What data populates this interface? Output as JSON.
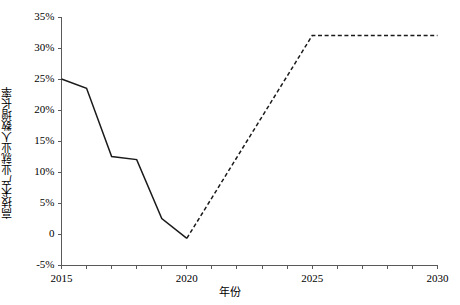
{
  "chart_data": {
    "type": "line",
    "title": "",
    "subtitle": "",
    "xlabel": "年份",
    "ylabel": "高技术产业就业人数增长率",
    "xlim": [
      2015,
      2030
    ],
    "ylim": [
      -5,
      35
    ],
    "grid": false,
    "legend": "none",
    "x_tick_labels": [
      "2015",
      "2020",
      "2025",
      "2030"
    ],
    "x_tick_values": [
      2015,
      2020,
      2025,
      2030
    ],
    "x_minor_ticks": [
      2015,
      2016,
      2017,
      2018,
      2019,
      2020,
      2021,
      2022,
      2023,
      2024,
      2025,
      2026,
      2027,
      2028,
      2029,
      2030
    ],
    "y_tick_labels": [
      "35%",
      "30%",
      "25%",
      "20%",
      "15%",
      "10%",
      "5%",
      "0",
      "-5%"
    ],
    "y_tick_values": [
      35,
      30,
      25,
      20,
      15,
      10,
      5,
      0,
      -5
    ],
    "series": [
      {
        "name": "历史值",
        "style": "solid",
        "color": "#1a1a1a",
        "x": [
          2015,
          2016,
          2017,
          2018,
          2019,
          2020
        ],
        "values": [
          25.0,
          23.5,
          12.5,
          12.0,
          2.5,
          -0.7
        ]
      },
      {
        "name": "预测值",
        "style": "dashed",
        "color": "#1a1a1a",
        "x": [
          2020,
          2025,
          2030
        ],
        "values": [
          -0.7,
          32.0,
          32.0
        ]
      }
    ]
  },
  "axes": {
    "y_axis_name": "y-axis",
    "x_axis_name": "x-axis"
  }
}
